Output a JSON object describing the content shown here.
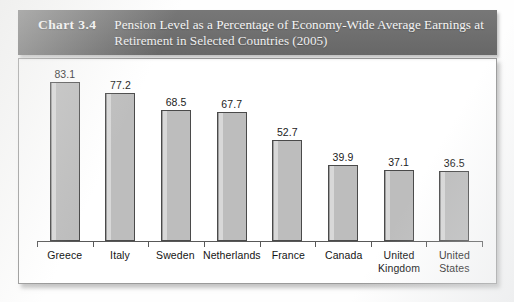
{
  "header": {
    "number": "Chart 3.4",
    "title": "Pension Level as a Percentage of Economy-Wide Average Earnings at Retirement in Selected Countries (2005)",
    "background_color": "#6f6f6f",
    "text_color": "#fbfbfb"
  },
  "chart_data": {
    "type": "bar",
    "title": "Pension Level as a Percentage of Economy-Wide Average Earnings at Retirement in Selected Countries (2005)",
    "xlabel": "",
    "ylabel": "",
    "ylim": [
      0,
      90
    ],
    "grid": false,
    "legend": "none",
    "bar_color": "#bdbdbd",
    "bar_border_color": "#4a4a4a",
    "categories": [
      "Greece",
      "Italy",
      "Sweden",
      "Netherlands",
      "France",
      "Canada",
      "United\nKingdom",
      "United\nStates"
    ],
    "values": [
      83.1,
      77.2,
      68.5,
      67.7,
      52.7,
      39.9,
      37.1,
      36.5
    ],
    "data_labels": [
      "83.1",
      "77.2",
      "68.5",
      "67.7",
      "52.7",
      "39.9",
      "37.1",
      "36.5"
    ]
  }
}
